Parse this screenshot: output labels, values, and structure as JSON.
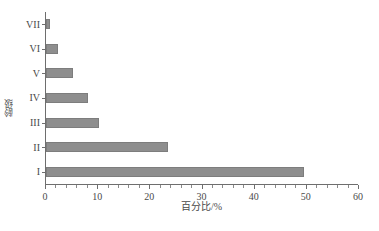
{
  "chart_data": {
    "type": "bar",
    "orientation": "horizontal",
    "title": "",
    "xlabel": "百分比/%",
    "ylabel": "龄级",
    "categories": [
      "I",
      "II",
      "III",
      "IV",
      "V",
      "VI",
      "VII"
    ],
    "values": [
      49.4,
      23.4,
      10.2,
      8.0,
      5.2,
      2.3,
      0.8
    ],
    "series": [
      {
        "name": "百分比",
        "values": [
          49.4,
          23.4,
          10.2,
          8.0,
          5.2,
          2.3,
          0.8
        ]
      }
    ],
    "xlim": [
      0,
      60
    ],
    "xticks": [
      0,
      10,
      20,
      30,
      40,
      50,
      60
    ],
    "xtick_labels": [
      "0",
      "10",
      "20",
      "30",
      "40",
      "50",
      "60"
    ],
    "minor_tick_step": 2,
    "grid": false,
    "legend": null,
    "bar_color": "#8e8e8e",
    "axis_color": "#6e6e6e",
    "background": "#ffffff"
  }
}
